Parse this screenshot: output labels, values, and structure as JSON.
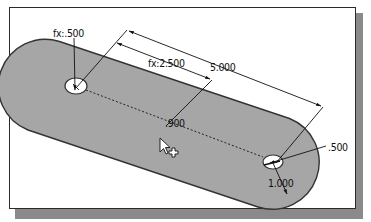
{
  "diagram": {
    "type": "cad-sketch-slot",
    "colors": {
      "part_fill": "#a6a6a6",
      "part_edge": "#333333",
      "hole_fill": "#ffffff",
      "dimension_line": "#111111",
      "frame_border": "#2a2a2a",
      "frame_shadow": "#8a8a8a"
    },
    "dimensions": {
      "hole_left_diameter": "fx:.500",
      "center_offset": "fx:2.500",
      "center_distance": "5.000",
      "slot_width": ".900",
      "hole_right_diameter": ".500",
      "end_radius": "1.000"
    },
    "cursor": {
      "pointer": "arrow-cursor",
      "crosshair": "+"
    }
  }
}
